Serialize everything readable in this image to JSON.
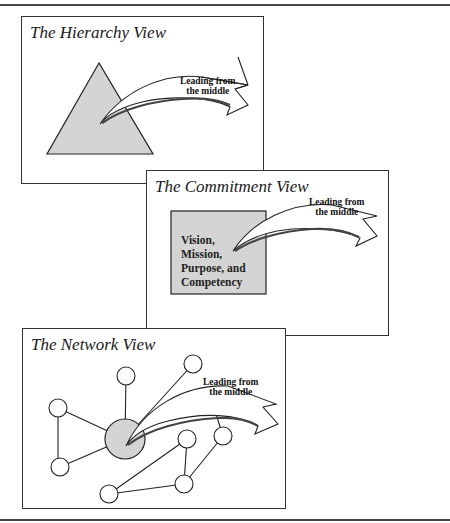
{
  "figure": {
    "panels": [
      {
        "id": "hierarchy",
        "title": "The Hierarchy View",
        "shape": "triangle",
        "arrow_label_line1": "Leading from",
        "arrow_label_line2": "the middle"
      },
      {
        "id": "commitment",
        "title": "The Commitment View",
        "shape": "rectangle",
        "shape_text": [
          "Vision,",
          "Mission,",
          "Purpose, and",
          "Competency"
        ],
        "arrow_label_line1": "Leading from",
        "arrow_label_line2": "the middle"
      },
      {
        "id": "network",
        "title": "The Network View",
        "shape": "network-graph",
        "arrow_label_line1": "Leading from",
        "arrow_label_line2": "the middle"
      }
    ],
    "colors": {
      "shape_fill": "#d4d4d4",
      "line": "#222222",
      "frame": "#444444"
    }
  }
}
